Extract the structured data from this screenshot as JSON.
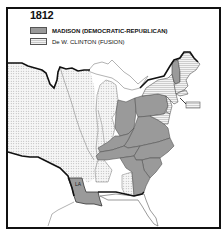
{
  "map": {
    "title": "1812",
    "legend": [
      {
        "label": "MADISON (DEMOCRATIC-REPUBLICAN)",
        "pattern": "solid-gray",
        "color": "#9a9a9a"
      },
      {
        "label": "De W. CLINTON (FUSION)",
        "pattern": "horizontal-stripes",
        "color": "#d0d0d0"
      }
    ],
    "state_labels": [
      {
        "text": "LA",
        "state": "Louisiana"
      }
    ],
    "regions": {
      "madison_states": [
        "Vermont",
        "Pennsylvania",
        "Ohio",
        "Virginia",
        "Kentucky",
        "Tennessee",
        "North Carolina",
        "South Carolina",
        "Georgia",
        "Louisiana"
      ],
      "clinton_states": [
        "New Hampshire",
        "Massachusetts",
        "Rhode Island",
        "Connecticut",
        "New York",
        "New Jersey",
        "Delaware",
        "Maryland (part)"
      ],
      "territories_pattern": "dotted",
      "colors": {
        "madison": "#9a9a9a",
        "territory_bg": "#f4f4f4",
        "border": "#111111"
      }
    }
  }
}
